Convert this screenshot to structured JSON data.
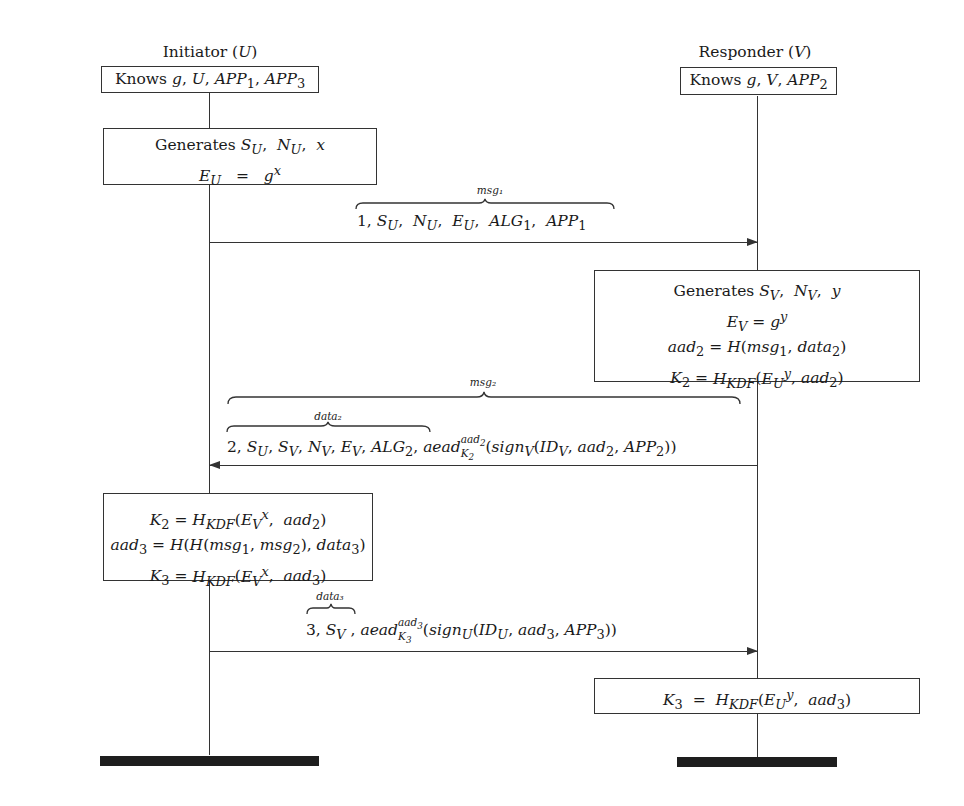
{
  "participants": {
    "initiator": {
      "title": "Initiator (U)",
      "knows": "Knows g, U, APP₁, APP₃"
    },
    "responder": {
      "title": "Responder (V)",
      "knows": "Knows g, V, APP₂"
    }
  },
  "steps": {
    "initiator_generate": {
      "lines": [
        "Generates S_U, N_U, x",
        "E_U  =  gˣ"
      ]
    },
    "message1": {
      "brace_label": "msg₁",
      "text": "1, S_U, N_U, E_U, ALG₁, APP₁",
      "direction": "U → V"
    },
    "responder_compute": {
      "lines": [
        "Generates S_V, N_V, y",
        "E_V = gʸ",
        "aad₂ = H(msg₁, data₂)",
        "K₂ = H_KDF(E_Uʸ, aad₂)"
      ]
    },
    "message2": {
      "outer_brace_label": "msg₂",
      "inner_brace_label": "data₂",
      "inner_text": "2, S_U, S_V, N_V, E_V, ALG₂",
      "outer_text": ", aead_K₂^aad₂(sign_V(ID_V, aad₂, APP₂))",
      "direction": "V → U"
    },
    "initiator_compute": {
      "lines": [
        "K₂ = H_KDF(E_Vˣ, aad₂)",
        "aad₃ = H(H(msg₁, msg₂), data₃)",
        "K₃ = H_KDF(E_Vˣ, aad₃)"
      ]
    },
    "message3": {
      "inner_brace_label": "data₃",
      "inner_text": "3, S_V",
      "outer_text": ", aead_K₃^aad₃(sign_U(ID_U, aad₃, APP₃))",
      "direction": "U → V"
    },
    "responder_final": {
      "lines": [
        "K₃  =  H_KDF(E_Uʸ, aad₃)"
      ]
    }
  },
  "colors": {
    "line": "#333333",
    "text": "#1a1a1a",
    "terminator": "#1e1e1e",
    "background": "#ffffff"
  }
}
